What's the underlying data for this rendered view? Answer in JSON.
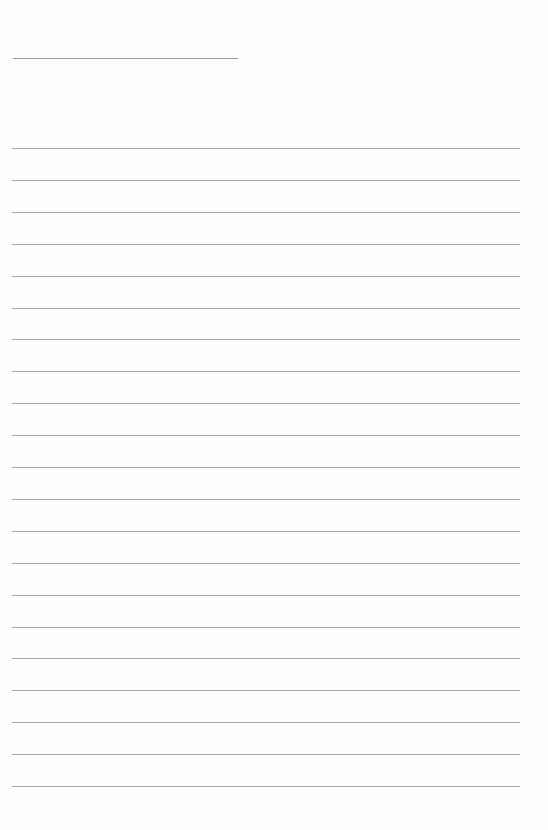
{
  "document": {
    "type": "lined-paper",
    "title_line": {
      "x": 13,
      "y": 58,
      "width": 225
    },
    "rules": {
      "count": 21,
      "first_y": 148,
      "spacing": 31.9,
      "x": 12,
      "width": 508
    },
    "colors": {
      "background": "#fefefe",
      "title_line": "#9a9a9a",
      "rule": "#a8a8a8"
    }
  }
}
